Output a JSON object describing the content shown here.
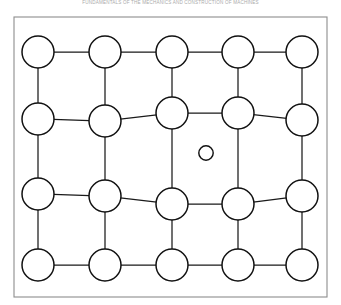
{
  "page": {
    "width": 341,
    "height": 305,
    "background": "#ffffff"
  },
  "running_head": {
    "text": "FUNDAMENTALS OF THE MECHANICS AND CONSTRUCTION OF MACHINES",
    "color": "#9b9b9b",
    "visible": true,
    "truncated_at_top": true
  },
  "figure": {
    "name": "interstitial-solid-solution-lattice-distortion",
    "frame": {
      "x": 14,
      "y": 17,
      "width": 313,
      "height": 280,
      "stroke": "#8d8d8d",
      "stroke_width": 1.1
    },
    "atom": {
      "radius": 16,
      "fill": "#ffffff",
      "stroke": "#111111",
      "stroke_width": 1.5
    },
    "interstitial_atom": {
      "cx": 206,
      "cy": 153,
      "radius": 7.2,
      "fill": "#ffffff",
      "stroke": "#111111",
      "stroke_width": 1.45
    },
    "bond": {
      "stroke": "#1a1a1a",
      "stroke_width": 1.25
    },
    "columns_x": [
      38,
      105,
      172,
      238,
      302
    ],
    "rows_y": [
      52,
      118,
      195,
      265
    ],
    "nodes": [
      {
        "id": "r0c0",
        "cx": 38,
        "cy": 52,
        "r": 16
      },
      {
        "id": "r0c1",
        "cx": 105,
        "cy": 52,
        "r": 16
      },
      {
        "id": "r0c2",
        "cx": 172,
        "cy": 52,
        "r": 16
      },
      {
        "id": "r0c3",
        "cx": 238,
        "cy": 52,
        "r": 16
      },
      {
        "id": "r0c4",
        "cx": 302,
        "cy": 52,
        "r": 16
      },
      {
        "id": "r1c0",
        "cx": 38,
        "cy": 119,
        "r": 16
      },
      {
        "id": "r1c1",
        "cx": 105,
        "cy": 121,
        "r": 16
      },
      {
        "id": "r1c2",
        "cx": 172,
        "cy": 113,
        "r": 16
      },
      {
        "id": "r1c3",
        "cx": 238,
        "cy": 113,
        "r": 16
      },
      {
        "id": "r1c4",
        "cx": 302,
        "cy": 120,
        "r": 16
      },
      {
        "id": "r2c0",
        "cx": 38,
        "cy": 194,
        "r": 16
      },
      {
        "id": "r2c1",
        "cx": 105,
        "cy": 196,
        "r": 16
      },
      {
        "id": "r2c2",
        "cx": 172,
        "cy": 204,
        "r": 16
      },
      {
        "id": "r2c3",
        "cx": 238,
        "cy": 204,
        "r": 16
      },
      {
        "id": "r2c4",
        "cx": 302,
        "cy": 196,
        "r": 16
      },
      {
        "id": "r3c0",
        "cx": 38,
        "cy": 265,
        "r": 16
      },
      {
        "id": "r3c1",
        "cx": 105,
        "cy": 265,
        "r": 16
      },
      {
        "id": "r3c2",
        "cx": 172,
        "cy": 265,
        "r": 16
      },
      {
        "id": "r3c3",
        "cx": 238,
        "cy": 265,
        "r": 16
      },
      {
        "id": "r3c4",
        "cx": 302,
        "cy": 265,
        "r": 16
      }
    ],
    "bonds": [
      [
        "r0c0",
        "r0c1"
      ],
      [
        "r0c1",
        "r0c2"
      ],
      [
        "r0c2",
        "r0c3"
      ],
      [
        "r0c3",
        "r0c4"
      ],
      [
        "r1c0",
        "r1c1"
      ],
      [
        "r1c1",
        "r1c2"
      ],
      [
        "r1c2",
        "r1c3"
      ],
      [
        "r1c3",
        "r1c4"
      ],
      [
        "r2c0",
        "r2c1"
      ],
      [
        "r2c1",
        "r2c2"
      ],
      [
        "r2c2",
        "r2c3"
      ],
      [
        "r2c3",
        "r2c4"
      ],
      [
        "r3c0",
        "r3c1"
      ],
      [
        "r3c1",
        "r3c2"
      ],
      [
        "r3c2",
        "r3c3"
      ],
      [
        "r3c3",
        "r3c4"
      ],
      [
        "r0c0",
        "r1c0"
      ],
      [
        "r0c1",
        "r1c1"
      ],
      [
        "r0c2",
        "r1c2"
      ],
      [
        "r0c3",
        "r1c3"
      ],
      [
        "r0c4",
        "r1c4"
      ],
      [
        "r1c0",
        "r2c0"
      ],
      [
        "r1c1",
        "r2c1"
      ],
      [
        "r1c2",
        "r2c2"
      ],
      [
        "r1c3",
        "r2c3"
      ],
      [
        "r1c4",
        "r2c4"
      ],
      [
        "r2c0",
        "r3c0"
      ],
      [
        "r2c1",
        "r3c1"
      ],
      [
        "r2c2",
        "r3c2"
      ],
      [
        "r2c3",
        "r3c3"
      ],
      [
        "r2c4",
        "r3c4"
      ]
    ]
  }
}
